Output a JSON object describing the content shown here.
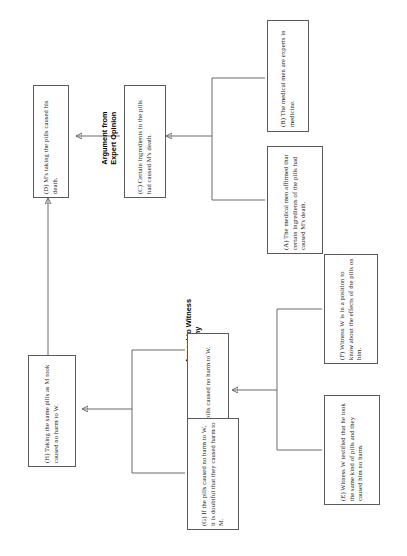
{
  "diagram": {
    "orientation": "landscape content rotated 90 degrees on portrait page",
    "schemes": [
      {
        "id": "scheme-expert-opinion",
        "label": "Argument from\nExpert Opinion"
      },
      {
        "id": "scheme-witness-testimony",
        "label": "Appeal to Witness\nTestimony"
      }
    ],
    "nodes": [
      {
        "id": "A",
        "label": "(A) The medical men affirmed that certain ingredients of the pills had caused M's death."
      },
      {
        "id": "B",
        "label": "(B) The medical men are experts in medicine."
      },
      {
        "id": "C",
        "label": "(C) Certain ingredients in the pills had caused M's death."
      },
      {
        "id": "D",
        "label": "(D) M's taking the pills caused his death."
      },
      {
        "id": "E",
        "label": "(E) Witness W testified that he took the same kind of pills and they caused him no harm."
      },
      {
        "id": "F",
        "label": "(F) Witness W is in a position to know about the effects of the pills on him."
      },
      {
        "id": "G",
        "label": "(G) If the pills caused no harm to W, it is doubtful that they caused harm to M."
      },
      {
        "id": "H",
        "label": "(H) Taking the same pills as M took caused no harm to W."
      },
      {
        "id": "I",
        "label": "(I) The pills caused no harm to W."
      }
    ],
    "edges": [
      {
        "from": "A+B",
        "to": "C",
        "scheme": "Argument from Expert Opinion"
      },
      {
        "from": "C",
        "to": "D",
        "scheme": ""
      },
      {
        "from": "E+F",
        "to": "I",
        "scheme": "Appeal to Witness Testimony"
      },
      {
        "from": "I",
        "to": "H",
        "scheme": ""
      },
      {
        "from": "G",
        "to": "H",
        "scheme": ""
      },
      {
        "from": "H",
        "to": "D",
        "scheme": ""
      }
    ],
    "colors": {
      "box_border": "#5a5a5a",
      "line": "#6b6b6b",
      "text": "#1a1a1a",
      "background": "#ffffff"
    }
  }
}
